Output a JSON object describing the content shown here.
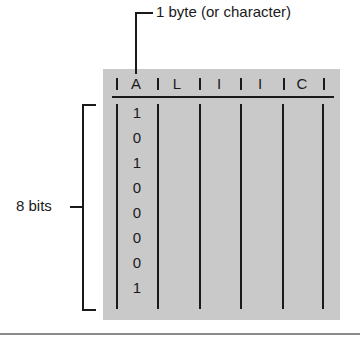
{
  "diagram": {
    "byte_label": "1 byte (or character)",
    "bits_label": "8 bits",
    "characters": [
      "A",
      "L",
      "I",
      "I",
      "C",
      "E"
    ],
    "bits": [
      "1",
      "0",
      "1",
      "0",
      "0",
      "0",
      "0",
      "1"
    ],
    "colors": {
      "panel": "#c9c9c9",
      "ink": "#1a1a1a",
      "background": "#ffffff",
      "bottom_rule": "#8a8a8a"
    }
  }
}
